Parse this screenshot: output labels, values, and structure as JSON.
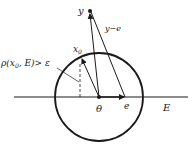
{
  "diagram": {
    "type": "geometric-vector-diagram",
    "colors": {
      "stroke": "#1a1a1a",
      "background": "#ffffff"
    },
    "labels": {
      "y": "y",
      "y_minus_e": "y−e",
      "x0": "x",
      "x0_sub": "0",
      "distance_condition": "ρ(x",
      "distance_condition_sub": "0",
      "distance_condition_rest": ", E)> ε",
      "theta": "θ",
      "e": "e",
      "E": "E"
    },
    "elements": {
      "circle": {
        "center": [
          99,
          97
        ],
        "radius": 44
      },
      "line_E": {
        "from": [
          14,
          97
        ],
        "to": [
          188,
          97
        ]
      },
      "point_y": [
        90,
        11
      ],
      "point_theta": [
        99,
        97
      ],
      "point_e": [
        125,
        97
      ],
      "point_x0": [
        81,
        57
      ],
      "dashed_drop": {
        "from": [
          80,
          64
        ],
        "to": [
          80,
          97
        ]
      }
    }
  }
}
